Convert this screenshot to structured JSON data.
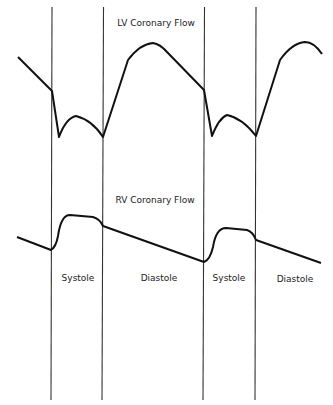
{
  "titles": {
    "lv": "LV Coronary Flow",
    "rv": "RV Coronary Flow"
  },
  "phases": [
    {
      "label": "Systole"
    },
    {
      "label": "Diastole"
    },
    {
      "label": "Systole"
    },
    {
      "label": "Diastole"
    }
  ],
  "colors": {
    "line": "#111111",
    "divider": "#333333",
    "background": "#ffffff"
  }
}
